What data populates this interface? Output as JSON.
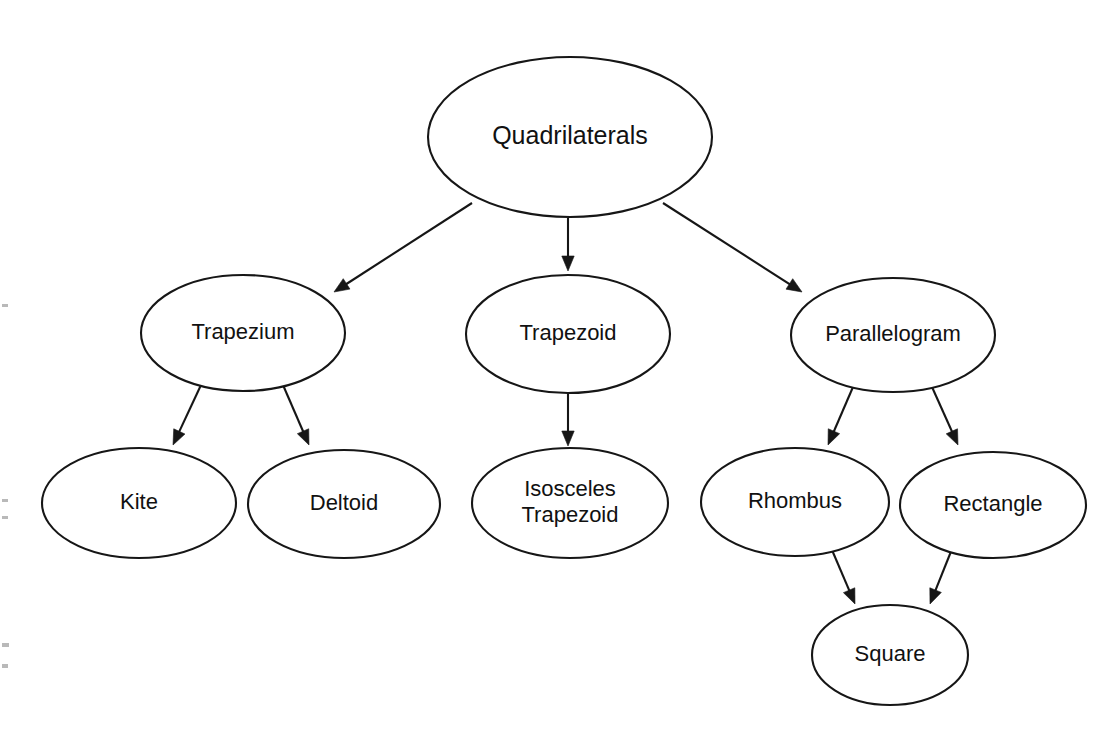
{
  "diagram": {
    "kind": "hierarchy-tree",
    "title": "Quadrilaterals",
    "background_color": "#ffffff",
    "stroke_color": "#161616",
    "text_color": "#111111",
    "nodes": [
      {
        "id": "quadrilaterals",
        "label": "Quadrilaterals",
        "lines": [
          "Quadrilaterals"
        ],
        "cx": 570,
        "cy": 137,
        "rx": 142,
        "ry": 80,
        "font_size": 25,
        "level": 0
      },
      {
        "id": "trapezium",
        "label": "Trapezium",
        "lines": [
          "Trapezium"
        ],
        "cx": 243,
        "cy": 333,
        "rx": 102,
        "ry": 58,
        "font_size": 22,
        "level": 1
      },
      {
        "id": "trapezoid",
        "label": "Trapezoid",
        "lines": [
          "Trapezoid"
        ],
        "cx": 568,
        "cy": 334,
        "rx": 102,
        "ry": 59,
        "font_size": 22,
        "level": 1
      },
      {
        "id": "parallelogram",
        "label": "Parallelogram",
        "lines": [
          "Parallelogram"
        ],
        "cx": 893,
        "cy": 335,
        "rx": 102,
        "ry": 57,
        "font_size": 22,
        "level": 1
      },
      {
        "id": "kite",
        "label": "Kite",
        "lines": [
          "Kite"
        ],
        "cx": 139,
        "cy": 503,
        "rx": 97,
        "ry": 55,
        "font_size": 22,
        "level": 2
      },
      {
        "id": "deltoid",
        "label": "Deltoid",
        "lines": [
          "Deltoid"
        ],
        "cx": 344,
        "cy": 504,
        "rx": 96,
        "ry": 54,
        "font_size": 22,
        "level": 2
      },
      {
        "id": "isosceles-trapezoid",
        "label": "Isosceles Trapezoid",
        "lines": [
          "Isosceles",
          "Trapezoid"
        ],
        "cx": 570,
        "cy": 503,
        "rx": 98,
        "ry": 55,
        "font_size": 22,
        "level": 2
      },
      {
        "id": "rhombus",
        "label": "Rhombus",
        "lines": [
          "Rhombus"
        ],
        "cx": 795,
        "cy": 502,
        "rx": 94,
        "ry": 54,
        "font_size": 22,
        "level": 2
      },
      {
        "id": "rectangle",
        "label": "Rectangle",
        "lines": [
          "Rectangle"
        ],
        "cx": 993,
        "cy": 505,
        "rx": 93,
        "ry": 53,
        "font_size": 22,
        "level": 2
      },
      {
        "id": "square",
        "label": "Square",
        "lines": [
          "Square"
        ],
        "cx": 890,
        "cy": 655,
        "rx": 78,
        "ry": 50,
        "font_size": 22,
        "level": 3
      }
    ],
    "edges": [
      {
        "id": "quadrilaterals-trapezium",
        "from": "quadrilaterals",
        "to": "trapezium",
        "x1": 472,
        "y1": 203,
        "x2": 334,
        "y2": 292
      },
      {
        "id": "quadrilaterals-trapezoid",
        "from": "quadrilaterals",
        "to": "trapezoid",
        "x1": 568,
        "y1": 218,
        "x2": 568,
        "y2": 271
      },
      {
        "id": "quadrilaterals-parallelogram",
        "from": "quadrilaterals",
        "to": "parallelogram",
        "x1": 663,
        "y1": 203,
        "x2": 802,
        "y2": 292
      },
      {
        "id": "trapezium-kite",
        "from": "trapezium",
        "to": "kite",
        "x1": 201,
        "y1": 385,
        "x2": 173,
        "y2": 445
      },
      {
        "id": "trapezium-deltoid",
        "from": "trapezium",
        "to": "deltoid",
        "x1": 283,
        "y1": 385,
        "x2": 309,
        "y2": 445
      },
      {
        "id": "trapezoid-isosceles-trapezoid",
        "from": "trapezoid",
        "to": "isosceles-trapezoid",
        "x1": 568,
        "y1": 393,
        "x2": 568,
        "y2": 446
      },
      {
        "id": "parallelogram-rhombus",
        "from": "parallelogram",
        "to": "rhombus",
        "x1": 853,
        "y1": 387,
        "x2": 828,
        "y2": 445
      },
      {
        "id": "parallelogram-rectangle",
        "from": "parallelogram",
        "to": "rectangle",
        "x1": 932,
        "y1": 387,
        "x2": 958,
        "y2": 445
      },
      {
        "id": "rhombus-square",
        "from": "rhombus",
        "to": "square",
        "x1": 832,
        "y1": 550,
        "x2": 855,
        "y2": 604
      },
      {
        "id": "rectangle-square",
        "from": "rectangle",
        "to": "square",
        "x1": 952,
        "y1": 549,
        "x2": 930,
        "y2": 604
      }
    ],
    "scan_marks": [
      {
        "id": "scan-mark-1",
        "x": 2,
        "y": 304,
        "w": 6,
        "h": 3
      },
      {
        "id": "scan-mark-2",
        "x": 2,
        "y": 499,
        "w": 6,
        "h": 3
      },
      {
        "id": "scan-mark-3",
        "x": 2,
        "y": 516,
        "w": 6,
        "h": 3
      },
      {
        "id": "scan-mark-4",
        "x": 2,
        "y": 643,
        "w": 7,
        "h": 4
      },
      {
        "id": "scan-mark-5",
        "x": 2,
        "y": 664,
        "w": 6,
        "h": 4
      }
    ]
  }
}
